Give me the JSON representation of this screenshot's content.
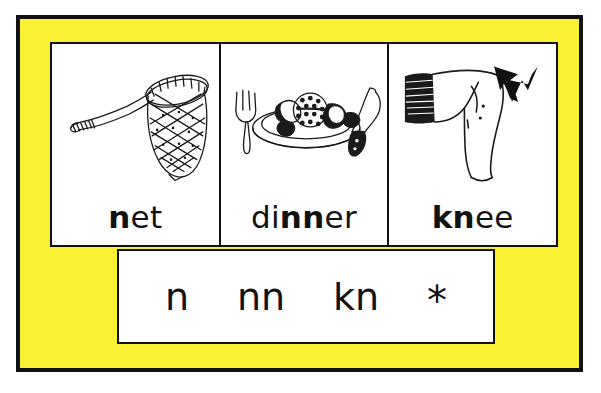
{
  "poster": {
    "background_color": "#faf134",
    "border_color": "#111111",
    "card_background": "#ffffff",
    "text_color": "#121212"
  },
  "cards": [
    {
      "word": "net",
      "highlight": "n",
      "plain": "et",
      "icon": "fishing-net-icon",
      "icon_label": "fishing net"
    },
    {
      "word": "dinner",
      "prefix": "di",
      "highlight": "nn",
      "plain": "er",
      "icon": "dinner-plate-icon",
      "icon_label": "plate of dinner with fork and knife"
    },
    {
      "word": "knee",
      "highlight": "kn",
      "plain": "ee",
      "icon": "knee-icon",
      "icon_label": "bent leg with arrow pointing at the knee"
    }
  ],
  "graphemes": [
    {
      "label": "n"
    },
    {
      "label": "nn"
    },
    {
      "label": "kn"
    },
    {
      "label": "*"
    }
  ]
}
